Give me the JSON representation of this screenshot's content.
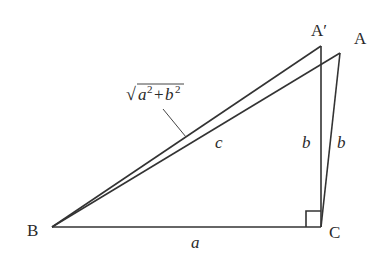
{
  "diagram": {
    "type": "geometry",
    "vertices": [
      {
        "id": "A_prime",
        "label": "A′",
        "x": 321,
        "y": 46
      },
      {
        "id": "A",
        "label": "A",
        "x": 340,
        "y": 53
      },
      {
        "id": "B",
        "label": "B",
        "x": 52,
        "y": 227
      },
      {
        "id": "C",
        "label": "C",
        "x": 321,
        "y": 227
      }
    ],
    "labels": {
      "vertex_A_prime": "A′",
      "vertex_A": "A",
      "vertex_B": "B",
      "vertex_C": "C",
      "side_a": "a",
      "side_b_left": "b",
      "side_b_right": "b",
      "side_c": "c",
      "hypotenuse_formula": "√a²+b²",
      "formula_sqrt": "√",
      "formula_a": "a",
      "formula_a_exp": "2",
      "formula_plus": "+",
      "formula_b": "b",
      "formula_b_exp": "2"
    },
    "edges": [
      {
        "from": "B",
        "to": "C",
        "label": "a"
      },
      {
        "from": "C",
        "to": "A_prime",
        "label": "b"
      },
      {
        "from": "C",
        "to": "A",
        "label": "b"
      },
      {
        "from": "B",
        "to": "A",
        "label": "c"
      },
      {
        "from": "B",
        "to": "A_prime",
        "label": "√a²+b²"
      }
    ],
    "right_angle_at": "C",
    "colors": {
      "line": "#333333",
      "text": "#2a2a2a",
      "background": "#ffffff"
    }
  }
}
